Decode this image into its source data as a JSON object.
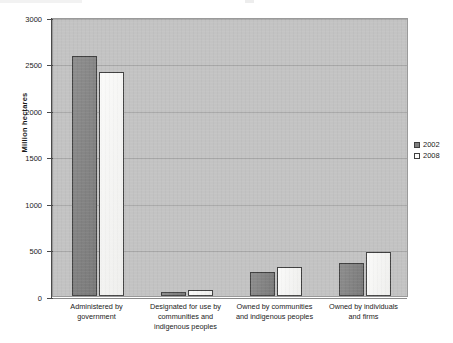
{
  "chart_data": {
    "type": "bar",
    "title": "",
    "subtitle": "",
    "xlabel": "",
    "ylabel": "Million hectares",
    "ylim": [
      0,
      3000
    ],
    "yticks": [
      0,
      500,
      1000,
      1500,
      2000,
      2500,
      3000
    ],
    "ytick_labels": [
      "0",
      "500",
      "1000",
      "1500",
      "2000",
      "2500",
      "3000"
    ],
    "grid": true,
    "legend_position": "right",
    "categories": [
      "Administered by government",
      "Designated for use by communities and indigenous peoples",
      "Owned by communities and indigenous peoples",
      "Owned by individuals and firms"
    ],
    "category_lines": [
      [
        "Administered by",
        "government"
      ],
      [
        "Designated for use by",
        "communities and",
        "indigenous peoples"
      ],
      [
        "Owned by communities",
        "and indigenous peoples"
      ],
      [
        "Owned by individuals",
        "and firms"
      ]
    ],
    "series": [
      {
        "name": "2002",
        "color": "#7f7f7f",
        "values": [
          2580,
          40,
          260,
          355
        ]
      },
      {
        "name": "2008",
        "color": "#f6f6f4",
        "values": [
          2410,
          70,
          310,
          475
        ]
      }
    ],
    "plot_background_color": "#c2c2c2",
    "gridline_color": "#a6a6a6",
    "bar_outline_color": "#3f3f3f"
  },
  "legend": {
    "items": [
      {
        "label": "2002",
        "swatch": "filled-square-dark"
      },
      {
        "label": "2008",
        "swatch": "empty-square-white"
      }
    ]
  }
}
